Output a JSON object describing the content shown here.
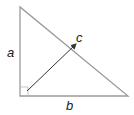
{
  "diagram": {
    "title": "",
    "type": "right-triangle",
    "labels": {
      "a": "a",
      "b": "b",
      "c": "c"
    },
    "colors": {
      "triangle_stroke": "#9a9a9a",
      "arrow_stroke": "#333333",
      "right_angle_marker": "#b0b0b0",
      "label_color": "#1a1a1a"
    }
  }
}
